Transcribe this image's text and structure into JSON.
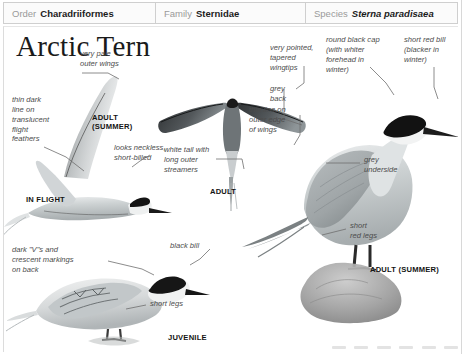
{
  "taxonomy": {
    "order": {
      "key": "Order",
      "value": "Charadriiformes"
    },
    "family": {
      "key": "Family",
      "value": "Sternidae"
    },
    "species": {
      "key": "Species",
      "value": "Sterna paradisaea"
    }
  },
  "title": "Arctic Tern",
  "annotations": {
    "very_pale_outer_wings": "very pale\nouter wings",
    "thin_dark_line": "thin dark\nline on\ntranslucent\nflight\nfeathers",
    "looks_neckless": "looks neckless,\nshort-billed",
    "white_tail_streamers": "white tail with\nlong outer\nstreamers",
    "thin_line_outer_edge": "thin line on\nouter edge\nof wings",
    "very_pointed_wingtips": "very pointed,\ntapered\nwingtips",
    "round_black_cap": "round black cap\n(with whiter\nforehead in\nwinter)",
    "short_red_bill": "short red bill\n(blacker in\nwinter)",
    "grey_back": "grey\nback",
    "grey_underside": "grey\nunderside",
    "short_red_legs": "short\nred legs",
    "dark_vs_crescents": "dark \"V\"s and\ncrescent markings\non back",
    "black_bill": "black bill",
    "short_legs": "short legs"
  },
  "plate_labels": {
    "adult_summer_flight": "ADULT\n(SUMMER)",
    "in_flight": "IN FLIGHT",
    "adult_overhead": "ADULT",
    "adult_summer_perched": "ADULT (SUMMER)",
    "juvenile": "JUVENILE"
  },
  "colors": {
    "page_background": "#ffffff",
    "header_background": "#fbfbfb",
    "header_border": "#cfcfcf",
    "label_key": "#9a9a9a",
    "label_value": "#1b1b1b",
    "annotation_text": "#4c4c4c",
    "plate_label_text": "#141414",
    "leader_line": "#6e6e6e",
    "bird_grey": "#b9bdbe",
    "bird_dark": "#1d1d1d",
    "rock_grey": "#9a9a9a"
  }
}
